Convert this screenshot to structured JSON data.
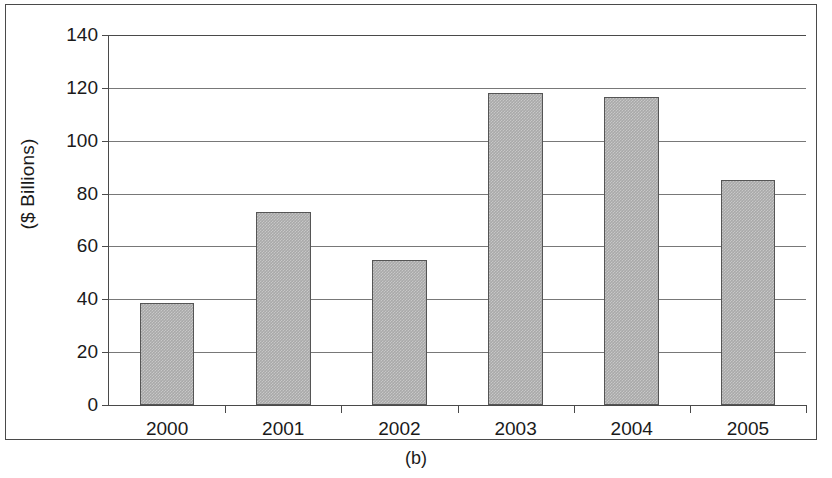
{
  "figure": {
    "caption": "(b)"
  },
  "chart_data": {
    "type": "bar",
    "title": "",
    "xlabel": "",
    "ylabel": "($ Billions)",
    "categories": [
      "2000",
      "2001",
      "2002",
      "2003",
      "2004",
      "2005"
    ],
    "values": [
      38.5,
      73,
      55,
      118,
      116.5,
      85
    ],
    "ylim": [
      0,
      140
    ],
    "ytick_labels": [
      "0",
      "20",
      "40",
      "60",
      "80",
      "100",
      "120",
      "140"
    ],
    "ytick_values": [
      0,
      20,
      40,
      60,
      80,
      100,
      120,
      140
    ],
    "grid": true,
    "legend": "none",
    "series_color": "#a9a9a9",
    "series_border_color": "#555555",
    "axis_color": "#4a4a4a",
    "gridline_color": "#787878"
  }
}
